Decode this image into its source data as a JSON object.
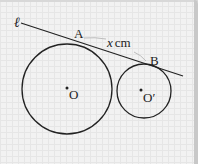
{
  "diagram": {
    "line_label": "ℓ",
    "point_A": "A",
    "point_B": "B",
    "distance_label": "x cm",
    "distance_var": "x",
    "distance_unit": "cm",
    "center_1": "O",
    "center_2": "O′"
  },
  "colors": {
    "stroke": "#222222",
    "brace": "#bdbdbd",
    "background": "#f2f2f2"
  }
}
